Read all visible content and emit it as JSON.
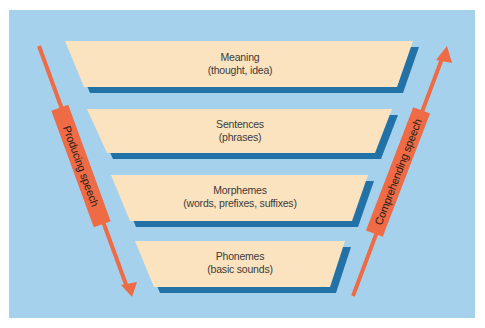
{
  "colors": {
    "page_background": "#ffffff",
    "panel_background": "#a6d1ec",
    "level_fill": "#fce3c0",
    "level_shadow": "#2272a8",
    "arrow": "#ee6b45",
    "text": "#3a3a3a"
  },
  "levels": [
    {
      "title": "Meaning",
      "subtitle": "(thought, idea)"
    },
    {
      "title": "Sentences",
      "subtitle": "(phrases)"
    },
    {
      "title": "Morphemes",
      "subtitle": "(words, prefixes, suffixes)"
    },
    {
      "title": "Phonemes",
      "subtitle": "(basic sounds)"
    }
  ],
  "arrows": {
    "left": {
      "label": "Producing speech",
      "direction": "down"
    },
    "right": {
      "label": "Comprehending speech",
      "direction": "up"
    }
  }
}
